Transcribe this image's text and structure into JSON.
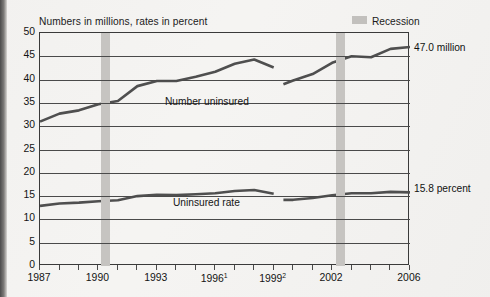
{
  "figure": {
    "axis_title": "Numbers in millions, rates in percent",
    "legend": {
      "label": "Recession",
      "swatch_color": "#c6c4c1"
    },
    "callout_top": "47.0 million",
    "callout_bottom": "15.8 percent",
    "series_label_top": "Number uninsured",
    "series_label_bottom": "Uninsured rate"
  },
  "chart_data": {
    "type": "line",
    "title": "Numbers in millions, rates in percent",
    "xlabel": "",
    "ylabel": "Numbers in millions, rates in percent",
    "ylim": [
      0,
      50
    ],
    "ytick_labels": [
      "0",
      "5",
      "10",
      "15",
      "20",
      "25",
      "30",
      "35",
      "40",
      "45",
      "50"
    ],
    "ytick_values": [
      0,
      5,
      10,
      15,
      20,
      25,
      30,
      35,
      40,
      45,
      50
    ],
    "grid": true,
    "xlim": [
      1987,
      2006
    ],
    "x": [
      1987,
      1988,
      1989,
      1990,
      1991,
      1992,
      1993,
      1994,
      1995,
      1996,
      1997,
      1998,
      1999,
      1999.5,
      2000,
      2001,
      2002,
      2003,
      2004,
      2005,
      2006
    ],
    "xtick_labels": [
      "1987",
      "1990",
      "1993",
      "1996",
      "1999",
      "2002",
      "2006"
    ],
    "xtick_label_superscripts": [
      "",
      "",
      "",
      "1",
      "2",
      "",
      ""
    ],
    "xtick_values": [
      1987,
      1990,
      1993,
      1996,
      1999,
      2002,
      2006
    ],
    "legend_position": "top-right",
    "annotations": [
      {
        "text": "Number uninsured",
        "x": 1995.0,
        "y": 38.0
      },
      {
        "text": "Uninsured rate",
        "x": 1995.0,
        "y": 12.6
      },
      {
        "text": "47.0 million",
        "x": 2006,
        "y": 47.0
      },
      {
        "text": "15.8 percent",
        "x": 2006,
        "y": 15.8
      }
    ],
    "shaded_regions": [
      {
        "label": "Recession",
        "x0": 1990.25,
        "x1": 1990.75
      },
      {
        "label": "Recession",
        "x0": 2001.2,
        "x1": 2001.7
      }
    ],
    "series": [
      {
        "name": "Number uninsured",
        "units": "millions",
        "values": [
          31.0,
          32.7,
          33.4,
          34.7,
          35.4,
          38.6,
          39.7,
          39.7,
          40.6,
          41.7,
          43.4,
          44.3,
          42.6,
          39.0,
          39.8,
          41.2,
          43.6,
          45.0,
          44.8,
          46.6,
          47.0
        ]
      },
      {
        "name": "Uninsured rate",
        "units": "percent",
        "values": [
          12.9,
          13.4,
          13.6,
          13.9,
          14.1,
          15.0,
          15.3,
          15.2,
          15.4,
          15.6,
          16.1,
          16.3,
          15.5,
          14.2,
          14.2,
          14.6,
          15.2,
          15.6,
          15.6,
          15.9,
          15.8
        ]
      }
    ],
    "series_breaks": [
      {
        "between_x": [
          1999,
          2000
        ],
        "reason": "data series discontinuity"
      }
    ]
  }
}
